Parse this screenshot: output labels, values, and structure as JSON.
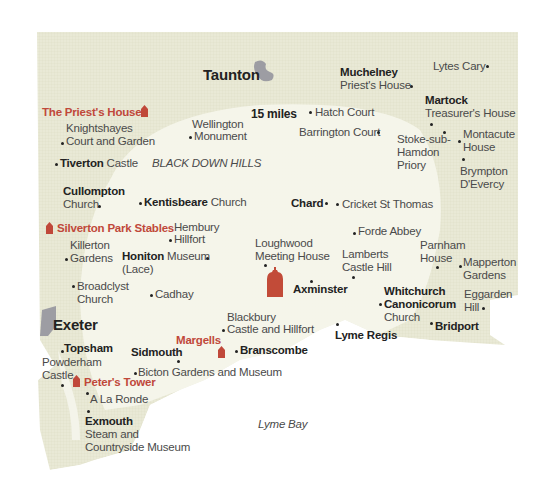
{
  "map": {
    "colors": {
      "land": "#e8e8d4",
      "land_pattern": "#dcdcc4",
      "radius": "#f6f6ee",
      "water": "#ffffff",
      "town_blob": "#9a9aa0",
      "accent_red": "#c0483a",
      "text": "#4a4a4a",
      "text_bold": "#222222"
    },
    "radius_label": "15 miles",
    "towns": {
      "taunton": "Taunton",
      "exeter": "Exeter"
    },
    "regions": {
      "black_down_hills": "BLACK DOWN HILLS"
    },
    "sea": {
      "lyme_bay": "Lyme Bay"
    },
    "featured": {
      "priests_house": "The Priest's House",
      "silverton": "Silverton Park Stables",
      "margells": "Margells",
      "peters_tower": "Peter's Tower"
    },
    "places": {
      "muchelney_1": "Muchelney",
      "muchelney_2": "Priest's House",
      "lytes": "Lytes Cary",
      "martock_1": "Martock",
      "martock_2": "Treasurer's House",
      "hatch": "Hatch Court",
      "barrington": "Barrington Court",
      "stoke_1": "Stoke-sub-",
      "stoke_2": "Hamdon",
      "stoke_3": "Priory",
      "montacute_1": "Montacute",
      "montacute_2": "House",
      "brympton_1": "Brympton",
      "brympton_2": "D'Evercy",
      "knight_1": "Knightshayes",
      "knight_2": "Court and Garden",
      "wellington_1": "Wellington",
      "wellington_2": "Monument",
      "tiverton_b": "Tiverton",
      "tiverton_r": " Castle",
      "cullompton_1": "Cullompton",
      "cullompton_2": "Church",
      "kentisbeare_b": "Kentisbeare",
      "kentisbeare_r": " Church",
      "chard": "Chard",
      "cricket": "Cricket St Thomas",
      "hembury_1": "Hembury",
      "hembury_2": "Hillfort",
      "killerton_1": "Killerton",
      "killerton_2": "Gardens",
      "honiton_b": "Honiton",
      "honiton_r": " Museum",
      "honiton_2": "(Lace)",
      "loughwood_1": "Loughwood",
      "loughwood_2": "Meeting House",
      "forde": "Forde Abbey",
      "lamberts_1": "Lamberts",
      "lamberts_2": "Castle Hill",
      "parnham_1": "Parnham",
      "parnham_2": "House",
      "mapperton_1": "Mapperton",
      "mapperton_2": "Gardens",
      "broadclyst_1": "Broadclyst",
      "broadclyst_2": "Church",
      "cadhay": "Cadhay",
      "axminster": "Axminster",
      "whitchurch_1": "Whitchurch",
      "whitchurch_2": "Canonicorum",
      "whitchurch_3": "Church",
      "eggarden_1": "Eggarden",
      "eggarden_2": "Hill",
      "blackbury_1": "Blackbury",
      "blackbury_2": "Castle and Hillfort",
      "lyme": "Lyme Regis",
      "bridport": "Bridport",
      "topsham": "Topsham",
      "powderham_1": "Powderham",
      "powderham_2": "Castle",
      "sidmouth": "Sidmouth",
      "branscombe": "Branscombe",
      "bicton": "Bicton Gardens and Museum",
      "alaronde": "A La Ronde",
      "exmouth_1": "Exmouth",
      "exmouth_2": "Steam and",
      "exmouth_3": "Countryside Museum"
    }
  }
}
